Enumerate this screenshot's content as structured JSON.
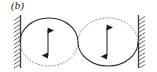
{
  "figure": {
    "panel_label": "(b)",
    "panel_letter": "b",
    "colors": {
      "ink": "#1a1a1a",
      "outline": "#2b2b2b",
      "dotted": "#8a8a8a",
      "wall": "#3a3a3a",
      "hatch": "#5a5a5a",
      "background": "#ffffff"
    }
  },
  "walls": {
    "left": {
      "name": "left-wall",
      "x": 20,
      "y_top": 15,
      "y_bottom": 68,
      "hatch_side": "left",
      "hatch_count": 13
    },
    "right": {
      "name": "right-wall",
      "x": 139,
      "y_top": 15,
      "y_bottom": 68,
      "hatch_side": "right",
      "hatch_count": 13
    }
  },
  "circles": [
    {
      "name": "left-bubble",
      "cx": 49,
      "cy": 42,
      "rx": 29,
      "ry": 24,
      "solid_arc": "upper",
      "dotted_arc": "lower",
      "arrow": {
        "x": 48,
        "y_top": 29,
        "y_bottom": 57,
        "heads": "both",
        "orientation": "vertical"
      }
    },
    {
      "name": "right-bubble",
      "cx": 108,
      "cy": 42,
      "rx": 30,
      "ry": 24,
      "solid_arc": "lower",
      "dotted_arc": "upper",
      "arrow": {
        "x": 107,
        "y_top": 26,
        "y_bottom": 58,
        "heads": "both",
        "orientation": "vertical"
      }
    }
  ]
}
